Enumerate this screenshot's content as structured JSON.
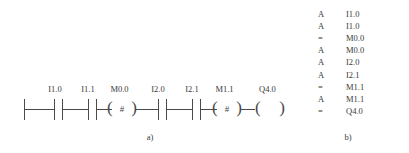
{
  "figure_a": {
    "caption": "a)",
    "type": "ladder-diagram",
    "elements": [
      {
        "kind": "power-rail",
        "label": ""
      },
      {
        "kind": "contact-no",
        "label": "I1.0"
      },
      {
        "kind": "contact-no",
        "label": "I1.1"
      },
      {
        "kind": "coil-hash",
        "label": "M0.0",
        "symbol": "#"
      },
      {
        "kind": "contact-no",
        "label": "I2.0"
      },
      {
        "kind": "contact-no",
        "label": "I2.1"
      },
      {
        "kind": "coil-hash",
        "label": "M1.1",
        "symbol": "#"
      },
      {
        "kind": "coil",
        "label": "Q4.0"
      }
    ]
  },
  "figure_b": {
    "caption": "b)",
    "type": "statement-list",
    "lines": [
      {
        "operator": "A",
        "operand": "I1.0"
      },
      {
        "operator": "A",
        "operand": "I1.0"
      },
      {
        "operator": "=",
        "operand": "M0.0"
      },
      {
        "operator": "A",
        "operand": "M0.0"
      },
      {
        "operator": "A",
        "operand": "I2.0"
      },
      {
        "operator": "A",
        "operand": "I2.1"
      },
      {
        "operator": "=",
        "operand": "M1.1"
      },
      {
        "operator": "A",
        "operand": "M1.1"
      },
      {
        "operator": "=",
        "operand": "Q4.0"
      }
    ]
  },
  "colors": {
    "line": "#4a4a4a",
    "text": "#3a3a3a",
    "background": "#ffffff"
  }
}
